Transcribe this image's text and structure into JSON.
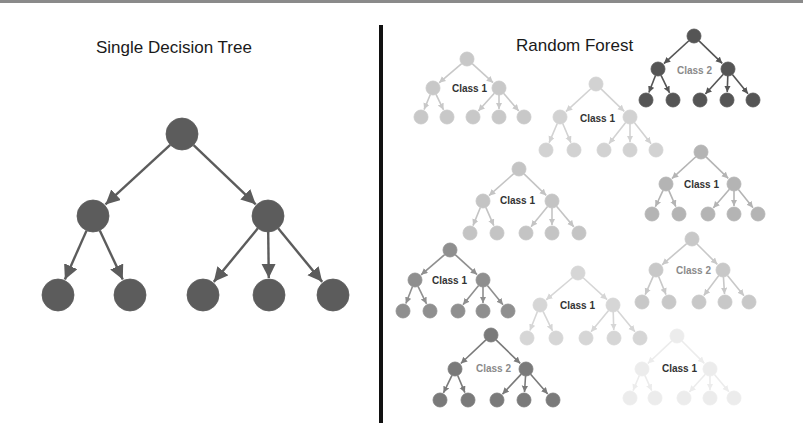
{
  "diagram": {
    "single_tree": {
      "title": "Single Decision Tree",
      "color": "#5c5c5c",
      "root": {
        "x": 182,
        "y": 134
      },
      "mids": [
        {
          "x": 93,
          "y": 216
        },
        {
          "x": 268,
          "y": 216
        }
      ],
      "leaves": [
        {
          "x": 58,
          "y": 295,
          "parent": 0
        },
        {
          "x": 130,
          "y": 295,
          "parent": 0
        },
        {
          "x": 203,
          "y": 295,
          "parent": 1
        },
        {
          "x": 269,
          "y": 295,
          "parent": 1
        },
        {
          "x": 333,
          "y": 295,
          "parent": 1
        }
      ],
      "radius": 16
    },
    "random_forest": {
      "title": "Random Forest",
      "trees": [
        {
          "label": "Class 1",
          "color": "#c8c8c8",
          "label_color": "#333333",
          "label_weight": "bold",
          "root": [
            467,
            59
          ],
          "mids": [
            [
              433,
              88
            ],
            [
              499,
              88
            ]
          ],
          "leaves_y": 117,
          "leaves_x": [
            421,
            447,
            473,
            499,
            524
          ],
          "label_pos": [
            452,
            92
          ]
        },
        {
          "label": "Class 1",
          "color": "#d2d2d2",
          "label_color": "#333333",
          "label_weight": "bold",
          "root": [
            596,
            84
          ],
          "mids": [
            [
              560,
              117
            ],
            [
              630,
              117
            ]
          ],
          "leaves_y": 150,
          "leaves_x": [
            546,
            574,
            604,
            630,
            656
          ],
          "label_pos": [
            580,
            122
          ]
        },
        {
          "label": "Class 2",
          "color": "#555555",
          "label_color": "#8a8a8a",
          "label_weight": "normal",
          "root": [
            694,
            36
          ],
          "mids": [
            [
              658,
              69
            ],
            [
              728,
              69
            ]
          ],
          "leaves_y": 100,
          "leaves_x": [
            646,
            673,
            700,
            727,
            753
          ],
          "label_pos": [
            677,
            74
          ]
        },
        {
          "label": "Class 1",
          "color": "#c4c4c4",
          "label_color": "#333333",
          "label_weight": "bold",
          "root": [
            519,
            169
          ],
          "mids": [
            [
              483,
              201
            ],
            [
              552,
              201
            ]
          ],
          "leaves_y": 233,
          "leaves_x": [
            470,
            497,
            526,
            552,
            579
          ],
          "label_pos": [
            500,
            204
          ]
        },
        {
          "label": "Class 1",
          "color": "#b4b4b4",
          "label_color": "#333333",
          "label_weight": "bold",
          "root": [
            701,
            152
          ],
          "mids": [
            [
              666,
              184
            ],
            [
              734,
              184
            ]
          ],
          "leaves_y": 214,
          "leaves_x": [
            652,
            679,
            708,
            734,
            758
          ],
          "label_pos": [
            684,
            188
          ]
        },
        {
          "label": "Class 1",
          "color": "#8f8f8f",
          "label_color": "#333333",
          "label_weight": "bold",
          "root": [
            450,
            250
          ],
          "mids": [
            [
              415,
              280
            ],
            [
              483,
              280
            ]
          ],
          "leaves_y": 311,
          "leaves_x": [
            403,
            430,
            458,
            483,
            508
          ],
          "label_pos": [
            432,
            284
          ]
        },
        {
          "label": "Class 2",
          "color": "#c8c8c8",
          "label_color": "#8a8a8a",
          "label_weight": "normal",
          "root": [
            692,
            239
          ],
          "mids": [
            [
              656,
              270
            ],
            [
              723,
              270
            ]
          ],
          "leaves_y": 302,
          "leaves_x": [
            642,
            669,
            699,
            725,
            749
          ],
          "label_pos": [
            676,
            274
          ]
        },
        {
          "label": "Class 1",
          "color": "#d6d6d6",
          "label_color": "#333333",
          "label_weight": "bold",
          "root": [
            578,
            273
          ],
          "mids": [
            [
              540,
              305
            ],
            [
              613,
              305
            ]
          ],
          "leaves_y": 338,
          "leaves_x": [
            527,
            556,
            586,
            614,
            640
          ],
          "label_pos": [
            560,
            309
          ]
        },
        {
          "label": "Class 2",
          "color": "#7a7a7a",
          "label_color": "#8a8a8a",
          "label_weight": "normal",
          "root": [
            491,
            335
          ],
          "mids": [
            [
              455,
              369
            ],
            [
              526,
              369
            ]
          ],
          "leaves_y": 400,
          "leaves_x": [
            440,
            468,
            497,
            524,
            553
          ],
          "label_pos": [
            476,
            372
          ]
        },
        {
          "label": "Class 1",
          "color": "#ececec",
          "label_color": "#333333",
          "label_weight": "bold",
          "root": [
            677,
            336
          ],
          "mids": [
            [
              642,
              369
            ],
            [
              710,
              369
            ]
          ],
          "leaves_y": 398,
          "leaves_x": [
            630,
            655,
            684,
            710,
            734
          ],
          "label_pos": [
            662,
            372
          ]
        }
      ],
      "node_radius": 7
    }
  }
}
